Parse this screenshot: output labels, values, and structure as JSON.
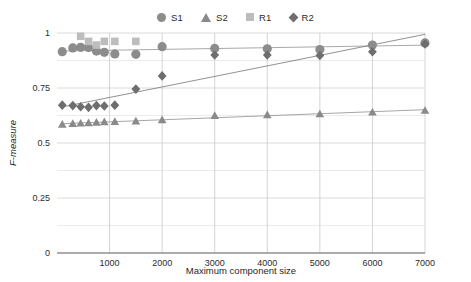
{
  "chart_data": {
    "type": "scatter",
    "title": "",
    "xlabel": "Maximum component size",
    "ylabel": "F-measure",
    "xlim": [
      0,
      7000
    ],
    "ylim": [
      0,
      1
    ],
    "xticks": [
      0,
      1000,
      2000,
      3000,
      4000,
      5000,
      6000,
      7000
    ],
    "xticklabels": [
      "",
      "1000",
      "2000",
      "3000",
      "4000",
      "5000",
      "6000",
      "7000"
    ],
    "yticks": [
      0,
      0.25,
      0.5,
      0.75,
      1
    ],
    "yticklabels": [
      "0",
      "0.25",
      "0.5",
      "0.75",
      "1"
    ],
    "minor_yticks": [
      0.125,
      0.375,
      0.625,
      0.875
    ],
    "grid": true,
    "legend_position": "top-center",
    "series": [
      {
        "name": "S1",
        "marker": "circle",
        "color": "#8c8c8c",
        "trendline": true,
        "points": [
          {
            "x": 100,
            "y": 0.915
          },
          {
            "x": 300,
            "y": 0.932
          },
          {
            "x": 450,
            "y": 0.935
          },
          {
            "x": 600,
            "y": 0.934
          },
          {
            "x": 750,
            "y": 0.918
          },
          {
            "x": 900,
            "y": 0.912
          },
          {
            "x": 1100,
            "y": 0.905
          },
          {
            "x": 1500,
            "y": 0.903
          },
          {
            "x": 2000,
            "y": 0.938
          },
          {
            "x": 3000,
            "y": 0.93
          },
          {
            "x": 4000,
            "y": 0.928
          },
          {
            "x": 5000,
            "y": 0.925
          },
          {
            "x": 6000,
            "y": 0.945
          },
          {
            "x": 7000,
            "y": 0.955
          }
        ]
      },
      {
        "name": "S2",
        "marker": "triangle",
        "color": "#8a8a8a",
        "trendline": true,
        "points": [
          {
            "x": 100,
            "y": 0.585
          },
          {
            "x": 300,
            "y": 0.588
          },
          {
            "x": 450,
            "y": 0.59
          },
          {
            "x": 600,
            "y": 0.592
          },
          {
            "x": 750,
            "y": 0.594
          },
          {
            "x": 900,
            "y": 0.596
          },
          {
            "x": 1100,
            "y": 0.597
          },
          {
            "x": 1500,
            "y": 0.6
          },
          {
            "x": 2000,
            "y": 0.605
          },
          {
            "x": 3000,
            "y": 0.625
          },
          {
            "x": 4000,
            "y": 0.628
          },
          {
            "x": 5000,
            "y": 0.632
          },
          {
            "x": 6000,
            "y": 0.64
          },
          {
            "x": 7000,
            "y": 0.648
          }
        ]
      },
      {
        "name": "R1",
        "marker": "square",
        "color": "#bdbdbd",
        "trendline": false,
        "points": [
          {
            "x": 450,
            "y": 0.985
          },
          {
            "x": 600,
            "y": 0.962
          },
          {
            "x": 750,
            "y": 0.945
          },
          {
            "x": 900,
            "y": 0.962
          },
          {
            "x": 1100,
            "y": 0.962
          },
          {
            "x": 1500,
            "y": 0.962
          }
        ]
      },
      {
        "name": "R2",
        "marker": "diamond",
        "color": "#6e6e6e",
        "trendline": true,
        "points": [
          {
            "x": 100,
            "y": 0.672
          },
          {
            "x": 300,
            "y": 0.67
          },
          {
            "x": 450,
            "y": 0.665
          },
          {
            "x": 600,
            "y": 0.662
          },
          {
            "x": 750,
            "y": 0.67
          },
          {
            "x": 900,
            "y": 0.668
          },
          {
            "x": 1100,
            "y": 0.672
          },
          {
            "x": 1500,
            "y": 0.745
          },
          {
            "x": 2000,
            "y": 0.805
          },
          {
            "x": 3000,
            "y": 0.9
          },
          {
            "x": 4000,
            "y": 0.9
          },
          {
            "x": 5000,
            "y": 0.898
          },
          {
            "x": 6000,
            "y": 0.915
          },
          {
            "x": 7000,
            "y": 0.95
          }
        ]
      }
    ]
  },
  "legend": {
    "items": [
      {
        "label": "S1",
        "marker": "circle",
        "color": "#8c8c8c"
      },
      {
        "label": "S2",
        "marker": "triangle",
        "color": "#8a8a8a"
      },
      {
        "label": "R1",
        "marker": "square",
        "color": "#bdbdbd"
      },
      {
        "label": "R2",
        "marker": "diamond",
        "color": "#6e6e6e"
      }
    ]
  },
  "axes": {
    "x_title": "Maximum component size",
    "y_title": "F-measure"
  }
}
